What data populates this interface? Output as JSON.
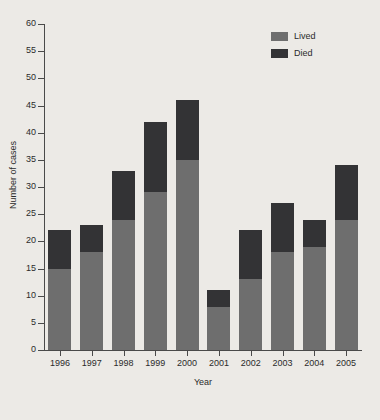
{
  "chart_data": {
    "type": "bar",
    "subtype": "stacked-vertical",
    "title": "",
    "xlabel": "Year",
    "ylabel": "Number of cases",
    "categories": [
      "1996",
      "1997",
      "1998",
      "1999",
      "2000",
      "2001",
      "2002",
      "2003",
      "2004",
      "2005"
    ],
    "series": [
      {
        "name": "Lived",
        "color": "#6e6e6e",
        "values": [
          15,
          18,
          24,
          29,
          35,
          8,
          13,
          18,
          19,
          24
        ]
      },
      {
        "name": "Died",
        "color": "#333335",
        "values": [
          7,
          5,
          9,
          13,
          11,
          3,
          9,
          9,
          5,
          10
        ]
      }
    ],
    "totals": [
      22,
      23,
      33,
      42,
      46,
      11,
      22,
      27,
      24,
      34
    ],
    "ylim": [
      0,
      60
    ],
    "yticks": [
      0,
      5,
      10,
      15,
      20,
      25,
      30,
      35,
      40,
      45,
      50,
      55,
      60
    ],
    "ytick_labels": [
      "0",
      "5",
      "10",
      "15",
      "20",
      "25",
      "30",
      "35",
      "40",
      "45",
      "50",
      "55",
      "60"
    ],
    "grid": false,
    "legend_position": "top-right",
    "legend_entries": [
      "Lived",
      "Died"
    ],
    "background_color": "#eceae6",
    "axis_color": "#4a4a4a"
  }
}
